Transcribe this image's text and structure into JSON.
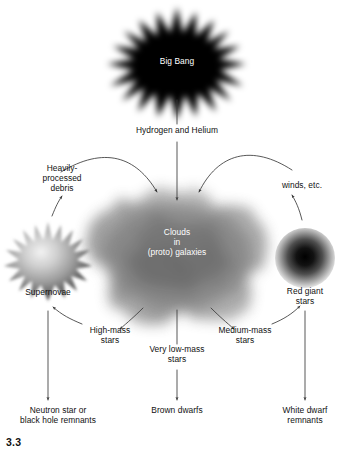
{
  "figure": {
    "number": "3.3",
    "nodes": {
      "big_bang": "Big Bang",
      "hydrogen_helium": "Hydrogen and Helium",
      "heavily_processed_debris": "Heavily-\nprocessed\ndebris",
      "winds_etc": "winds, etc.",
      "clouds": "Clouds\nin\n(proto) galaxies",
      "supernovae": "Supernovae",
      "red_giant_stars": "Red giant\nstars",
      "high_mass_stars": "High-mass\nstars",
      "very_low_mass_stars": "Very low-mass\nstars",
      "medium_mass_stars": "Medium-mass\nstars",
      "neutron_star_remnants": "Neutron star or\nblack hole remnants",
      "brown_dwarfs": "Brown dwarfs",
      "white_dwarf_remnants": "White dwarf\nremnants"
    },
    "colors": {
      "background": "#ffffff",
      "text": "#111111",
      "text_on_dark": "#ffffff",
      "arrow": "#3a3a3a",
      "big_bang_fill": "#000000",
      "cloud_fill": "#8a8a8a",
      "supernova_fill": "#9a9a9a",
      "red_giant_fill": "#1c1c1c"
    }
  }
}
